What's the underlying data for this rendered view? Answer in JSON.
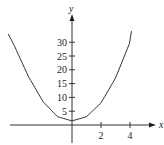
{
  "chart_data": {
    "type": "line",
    "title": "",
    "xlabel": "x",
    "ylabel": "y",
    "x_ticks": [
      2,
      4
    ],
    "y_ticks": [
      5,
      10,
      15,
      20,
      25,
      30
    ],
    "xlim": [
      -4.5,
      5.5
    ],
    "ylim": [
      -2,
      38
    ],
    "grid": false,
    "legend": null,
    "series": [
      {
        "name": "parabola",
        "x": [
          -4.4,
          -4,
          -3,
          -2,
          -1,
          0,
          1,
          2,
          3,
          4,
          4.1
        ],
        "y": [
          33,
          29,
          17.5,
          8.5,
          3,
          1.5,
          3,
          8,
          17,
          30,
          34
        ]
      }
    ]
  },
  "labels": {
    "x_axis": "x",
    "y_axis": "y",
    "x_tick_labels": [
      "2",
      "4"
    ],
    "y_tick_labels": [
      "5",
      "10",
      "15",
      "20",
      "25",
      "30"
    ]
  }
}
